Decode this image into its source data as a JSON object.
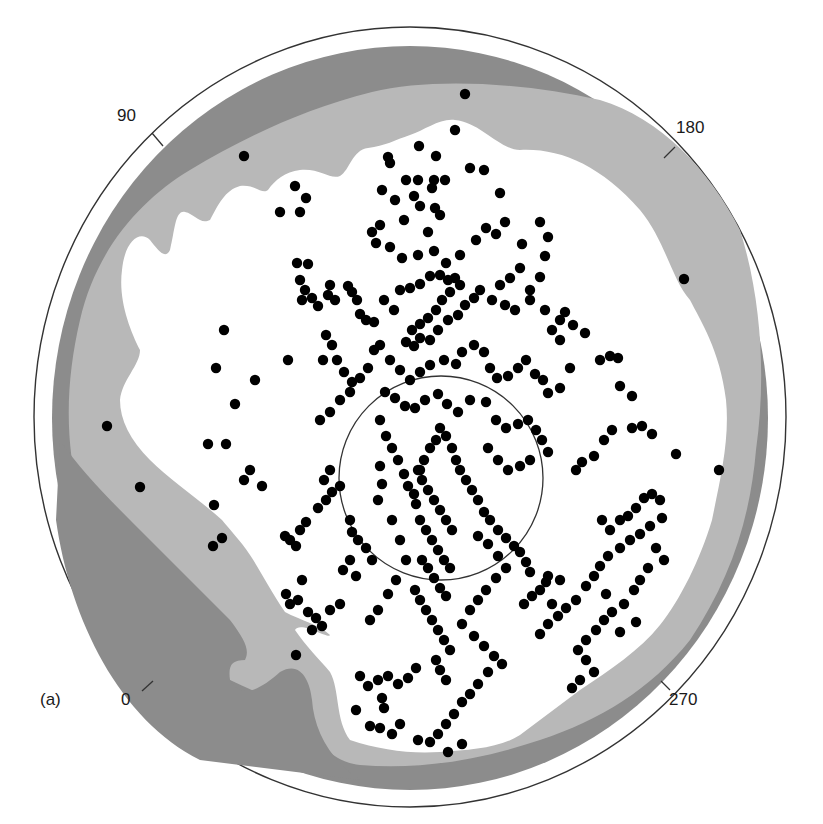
{
  "figure": {
    "panel_label": "(a)",
    "azimuth_labels": [
      {
        "text": "90",
        "x": 118,
        "y": 106
      },
      {
        "text": "180",
        "x": 676,
        "y": 118
      },
      {
        "text": "0",
        "x": 122,
        "y": 690
      },
      {
        "text": "270",
        "x": 668,
        "y": 690
      }
    ],
    "colors": {
      "outer_ring": "#ffffff",
      "dark_zone": "#8c8c8c",
      "light_zone": "#b8b8b8",
      "clear_zone": "#ffffff",
      "dots": "#000000",
      "lines": "#333333"
    }
  },
  "chart_data": {
    "type": "scatter",
    "title": "",
    "azimuth_ticks": [
      0,
      90,
      180,
      270
    ],
    "outer_circle": {
      "cx": 410,
      "cy": 417,
      "rx": 376,
      "ry": 390
    },
    "inner_circle": {
      "cx": 441,
      "cy": 478,
      "r": 102
    },
    "zones": [
      "dark grey (outer)",
      "light grey (intermediate)",
      "white (core)"
    ],
    "points": [
      [
        465,
        94
      ],
      [
        244,
        156
      ],
      [
        684,
        279
      ],
      [
        107,
        426
      ],
      [
        140,
        487
      ],
      [
        719,
        470
      ],
      [
        296,
        655
      ],
      [
        455,
        130
      ],
      [
        388,
        157
      ],
      [
        390,
        163
      ],
      [
        419,
        146
      ],
      [
        436,
        156
      ],
      [
        406,
        180
      ],
      [
        418,
        180
      ],
      [
        434,
        180
      ],
      [
        432,
        188
      ],
      [
        445,
        180
      ],
      [
        470,
        168
      ],
      [
        484,
        170
      ],
      [
        500,
        193
      ],
      [
        382,
        190
      ],
      [
        395,
        200
      ],
      [
        414,
        196
      ],
      [
        420,
        206
      ],
      [
        435,
        208
      ],
      [
        440,
        215
      ],
      [
        295,
        186
      ],
      [
        280,
        212
      ],
      [
        300,
        212
      ],
      [
        306,
        198
      ],
      [
        372,
        232
      ],
      [
        380,
        225
      ],
      [
        404,
        220
      ],
      [
        428,
        232
      ],
      [
        376,
        243
      ],
      [
        390,
        247
      ],
      [
        402,
        258
      ],
      [
        418,
        255
      ],
      [
        434,
        251
      ],
      [
        446,
        263
      ],
      [
        460,
        255
      ],
      [
        476,
        240
      ],
      [
        486,
        228
      ],
      [
        496,
        234
      ],
      [
        505,
        222
      ],
      [
        522,
        244
      ],
      [
        540,
        222
      ],
      [
        548,
        237
      ],
      [
        545,
        256
      ],
      [
        520,
        268
      ],
      [
        510,
        278
      ],
      [
        500,
        285
      ],
      [
        530,
        290
      ],
      [
        540,
        277
      ],
      [
        297,
        263
      ],
      [
        308,
        264
      ],
      [
        300,
        280
      ],
      [
        305,
        290
      ],
      [
        302,
        300
      ],
      [
        312,
        298
      ],
      [
        318,
        306
      ],
      [
        330,
        285
      ],
      [
        328,
        295
      ],
      [
        335,
        300
      ],
      [
        348,
        286
      ],
      [
        352,
        292
      ],
      [
        357,
        300
      ],
      [
        360,
        314
      ],
      [
        366,
        320
      ],
      [
        374,
        322
      ],
      [
        384,
        300
      ],
      [
        394,
        310
      ],
      [
        400,
        290
      ],
      [
        410,
        288
      ],
      [
        420,
        284
      ],
      [
        430,
        276
      ],
      [
        440,
        275
      ],
      [
        448,
        280
      ],
      [
        455,
        278
      ],
      [
        460,
        285
      ],
      [
        450,
        292
      ],
      [
        442,
        300
      ],
      [
        436,
        310
      ],
      [
        428,
        318
      ],
      [
        420,
        324
      ],
      [
        412,
        330
      ],
      [
        406,
        342
      ],
      [
        414,
        346
      ],
      [
        420,
        338
      ],
      [
        430,
        340
      ],
      [
        438,
        330
      ],
      [
        448,
        320
      ],
      [
        458,
        315
      ],
      [
        465,
        305
      ],
      [
        474,
        298
      ],
      [
        480,
        290
      ],
      [
        492,
        300
      ],
      [
        505,
        305
      ],
      [
        515,
        310
      ],
      [
        530,
        300
      ],
      [
        545,
        310
      ],
      [
        560,
        320
      ],
      [
        565,
        312
      ],
      [
        326,
        335
      ],
      [
        332,
        345
      ],
      [
        323,
        360
      ],
      [
        337,
        360
      ],
      [
        344,
        372
      ],
      [
        352,
        382
      ],
      [
        360,
        378
      ],
      [
        368,
        368
      ],
      [
        374,
        350
      ],
      [
        380,
        345
      ],
      [
        390,
        360
      ],
      [
        400,
        370
      ],
      [
        410,
        380
      ],
      [
        420,
        372
      ],
      [
        430,
        365
      ],
      [
        444,
        360
      ],
      [
        456,
        364
      ],
      [
        462,
        352
      ],
      [
        474,
        345
      ],
      [
        484,
        352
      ],
      [
        490,
        368
      ],
      [
        497,
        378
      ],
      [
        508,
        376
      ],
      [
        518,
        368
      ],
      [
        526,
        360
      ],
      [
        535,
        374
      ],
      [
        543,
        380
      ],
      [
        548,
        393
      ],
      [
        560,
        388
      ],
      [
        570,
        368
      ],
      [
        560,
        340
      ],
      [
        552,
        330
      ],
      [
        573,
        325
      ],
      [
        585,
        333
      ],
      [
        600,
        360
      ],
      [
        610,
        356
      ],
      [
        618,
        358
      ],
      [
        620,
        386
      ],
      [
        632,
        396
      ],
      [
        224,
        330
      ],
      [
        216,
        368
      ],
      [
        288,
        360
      ],
      [
        235,
        404
      ],
      [
        255,
        380
      ],
      [
        320,
        420
      ],
      [
        330,
        412
      ],
      [
        340,
        400
      ],
      [
        350,
        392
      ],
      [
        385,
        392
      ],
      [
        395,
        398
      ],
      [
        405,
        406
      ],
      [
        415,
        408
      ],
      [
        425,
        400
      ],
      [
        438,
        394
      ],
      [
        447,
        404
      ],
      [
        458,
        412
      ],
      [
        470,
        400
      ],
      [
        486,
        402
      ],
      [
        496,
        420
      ],
      [
        506,
        428
      ],
      [
        518,
        424
      ],
      [
        528,
        420
      ],
      [
        536,
        430
      ],
      [
        542,
        440
      ],
      [
        548,
        452
      ],
      [
        530,
        460
      ],
      [
        520,
        466
      ],
      [
        508,
        470
      ],
      [
        498,
        460
      ],
      [
        488,
        448
      ],
      [
        380,
        420
      ],
      [
        386,
        436
      ],
      [
        392,
        448
      ],
      [
        398,
        460
      ],
      [
        404,
        474
      ],
      [
        408,
        486
      ],
      [
        414,
        494
      ],
      [
        416,
        504
      ],
      [
        420,
        470
      ],
      [
        424,
        460
      ],
      [
        430,
        448
      ],
      [
        436,
        440
      ],
      [
        440,
        428
      ],
      [
        446,
        436
      ],
      [
        452,
        448
      ],
      [
        456,
        460
      ],
      [
        460,
        470
      ],
      [
        466,
        480
      ],
      [
        472,
        490
      ],
      [
        478,
        500
      ],
      [
        484,
        512
      ],
      [
        490,
        520
      ],
      [
        498,
        530
      ],
      [
        506,
        538
      ],
      [
        514,
        546
      ],
      [
        520,
        552
      ],
      [
        526,
        562
      ],
      [
        530,
        572
      ],
      [
        418,
        470
      ],
      [
        422,
        480
      ],
      [
        428,
        490
      ],
      [
        434,
        500
      ],
      [
        440,
        510
      ],
      [
        446,
        520
      ],
      [
        452,
        530
      ],
      [
        420,
        520
      ],
      [
        426,
        530
      ],
      [
        432,
        540
      ],
      [
        438,
        550
      ],
      [
        444,
        560
      ],
      [
        450,
        568
      ],
      [
        422,
        560
      ],
      [
        428,
        568
      ],
      [
        434,
        578
      ],
      [
        440,
        588
      ],
      [
        446,
        596
      ],
      [
        415,
        590
      ],
      [
        420,
        600
      ],
      [
        426,
        610
      ],
      [
        432,
        620
      ],
      [
        438,
        630
      ],
      [
        444,
        640
      ],
      [
        450,
        650
      ],
      [
        436,
        660
      ],
      [
        440,
        670
      ],
      [
        446,
        680
      ],
      [
        380,
        466
      ],
      [
        382,
        484
      ],
      [
        378,
        500
      ],
      [
        392,
        520
      ],
      [
        400,
        540
      ],
      [
        406,
        560
      ],
      [
        396,
        580
      ],
      [
        388,
        594
      ],
      [
        378,
        610
      ],
      [
        370,
        620
      ],
      [
        208,
        444
      ],
      [
        226,
        444
      ],
      [
        250,
        470
      ],
      [
        244,
        480
      ],
      [
        262,
        486
      ],
      [
        214,
        505
      ],
      [
        213,
        546
      ],
      [
        222,
        538
      ],
      [
        285,
        536
      ],
      [
        290,
        540
      ],
      [
        296,
        546
      ],
      [
        300,
        530
      ],
      [
        306,
        522
      ],
      [
        318,
        508
      ],
      [
        326,
        500
      ],
      [
        332,
        492
      ],
      [
        340,
        486
      ],
      [
        324,
        480
      ],
      [
        330,
        470
      ],
      [
        350,
        520
      ],
      [
        352,
        532
      ],
      [
        358,
        540
      ],
      [
        366,
        548
      ],
      [
        372,
        560
      ],
      [
        350,
        560
      ],
      [
        343,
        570
      ],
      [
        356,
        576
      ],
      [
        302,
        580
      ],
      [
        286,
        594
      ],
      [
        290,
        604
      ],
      [
        298,
        600
      ],
      [
        308,
        612
      ],
      [
        316,
        618
      ],
      [
        322,
        626
      ],
      [
        312,
        630
      ],
      [
        330,
        610
      ],
      [
        340,
        604
      ],
      [
        576,
        470
      ],
      [
        582,
        462
      ],
      [
        594,
        456
      ],
      [
        604,
        440
      ],
      [
        612,
        430
      ],
      [
        632,
        428
      ],
      [
        652,
        434
      ],
      [
        676,
        454
      ],
      [
        642,
        426
      ],
      [
        602,
        520
      ],
      [
        610,
        530
      ],
      [
        620,
        520
      ],
      [
        628,
        516
      ],
      [
        636,
        508
      ],
      [
        644,
        498
      ],
      [
        652,
        494
      ],
      [
        660,
        500
      ],
      [
        662,
        518
      ],
      [
        650,
        526
      ],
      [
        640,
        534
      ],
      [
        630,
        540
      ],
      [
        620,
        548
      ],
      [
        608,
        556
      ],
      [
        600,
        566
      ],
      [
        594,
        576
      ],
      [
        586,
        586
      ],
      [
        576,
        600
      ],
      [
        566,
        608
      ],
      [
        558,
        616
      ],
      [
        548,
        624
      ],
      [
        540,
        634
      ],
      [
        656,
        548
      ],
      [
        664,
        560
      ],
      [
        648,
        568
      ],
      [
        640,
        580
      ],
      [
        634,
        590
      ],
      [
        624,
        604
      ],
      [
        612,
        612
      ],
      [
        604,
        620
      ],
      [
        596,
        630
      ],
      [
        586,
        640
      ],
      [
        578,
        650
      ],
      [
        586,
        660
      ],
      [
        594,
        672
      ],
      [
        580,
        680
      ],
      [
        572,
        688
      ],
      [
        620,
        632
      ],
      [
        636,
        622
      ],
      [
        606,
        594
      ],
      [
        552,
        604
      ],
      [
        548,
        576
      ],
      [
        478,
        536
      ],
      [
        488,
        544
      ],
      [
        498,
        556
      ],
      [
        506,
        568
      ],
      [
        496,
        578
      ],
      [
        486,
        590
      ],
      [
        478,
        600
      ],
      [
        470,
        610
      ],
      [
        462,
        624
      ],
      [
        474,
        636
      ],
      [
        484,
        646
      ],
      [
        494,
        656
      ],
      [
        502,
        664
      ],
      [
        488,
        672
      ],
      [
        478,
        684
      ],
      [
        470,
        694
      ],
      [
        462,
        702
      ],
      [
        454,
        714
      ],
      [
        446,
        724
      ],
      [
        438,
        734
      ],
      [
        430,
        742
      ],
      [
        462,
        744
      ],
      [
        448,
        752
      ],
      [
        418,
        740
      ],
      [
        400,
        724
      ],
      [
        392,
        734
      ],
      [
        380,
        728
      ],
      [
        370,
        726
      ],
      [
        360,
        676
      ],
      [
        368,
        686
      ],
      [
        378,
        680
      ],
      [
        388,
        676
      ],
      [
        398,
        684
      ],
      [
        408,
        678
      ],
      [
        416,
        668
      ],
      [
        382,
        698
      ],
      [
        384,
        708
      ],
      [
        356,
        710
      ],
      [
        524,
        604
      ],
      [
        532,
        596
      ],
      [
        540,
        590
      ],
      [
        546,
        582
      ],
      [
        560,
        580
      ]
    ]
  }
}
